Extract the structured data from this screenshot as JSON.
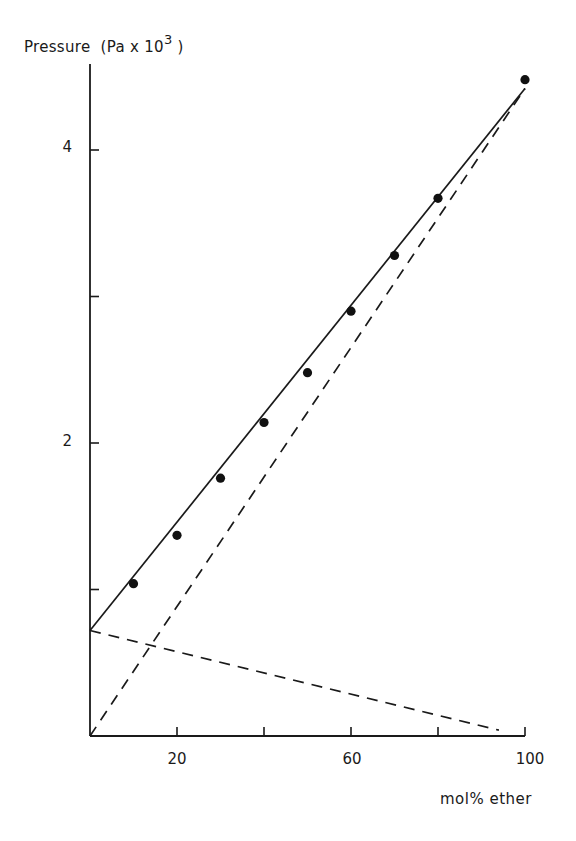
{
  "chart_data": {
    "type": "scatter",
    "title": "",
    "ylabel": "Pressure",
    "ylabel_units_prefix": "(Pa x 10",
    "ylabel_units_exp": "3",
    "ylabel_units_suffix": " )",
    "xlabel": "mol% ether",
    "xlim": [
      0,
      100
    ],
    "ylim": [
      0,
      4.6
    ],
    "x_ticks": [
      0,
      20,
      40,
      60,
      80,
      100
    ],
    "x_tick_labels": [
      "",
      "20",
      "",
      "60",
      "",
      "100"
    ],
    "y_ticks": [
      1,
      2,
      3,
      4
    ],
    "y_tick_labels": [
      "",
      "2",
      "",
      "4"
    ],
    "grid": false,
    "series": [
      {
        "name": "measured total pressure",
        "style": "points",
        "x": [
          10,
          20,
          30,
          40,
          50,
          60,
          70,
          80,
          100
        ],
        "y": [
          1.04,
          1.37,
          1.76,
          2.14,
          2.48,
          2.9,
          3.28,
          3.67,
          4.48
        ]
      },
      {
        "name": "ideal total pressure (Raoult)",
        "style": "solid",
        "x": [
          0,
          100
        ],
        "y": [
          0.72,
          4.42
        ]
      },
      {
        "name": "ideal ether partial pressure",
        "style": "dashed",
        "x": [
          0,
          100
        ],
        "y": [
          0,
          4.42
        ]
      },
      {
        "name": "ideal second-component partial pressure",
        "style": "dashed",
        "x": [
          0,
          94
        ],
        "y": [
          0.72,
          0.04
        ]
      }
    ]
  }
}
